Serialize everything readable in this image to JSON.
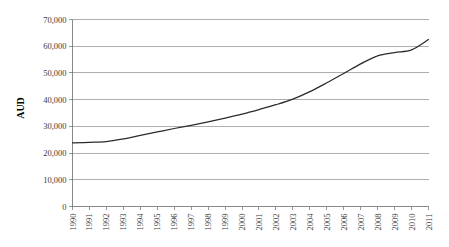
{
  "chart_data": {
    "type": "line",
    "title": "",
    "xlabel": "",
    "ylabel": "AUD",
    "ylim": [
      0,
      70000
    ],
    "ytick_values": [
      0,
      10000,
      20000,
      30000,
      40000,
      50000,
      60000,
      70000
    ],
    "ytick_labels": [
      "0",
      "10,000",
      "20,000",
      "30,000",
      "40,000",
      "50,000",
      "60,000",
      "70,000"
    ],
    "grid": true,
    "legend": "none",
    "line_color": "#2b2b2b",
    "categories": [
      "1990",
      "1991",
      "1992",
      "1993",
      "1994",
      "1995",
      "1996",
      "1997",
      "1998",
      "1999",
      "2000",
      "2001",
      "2002",
      "2003",
      "2004",
      "2005",
      "2006",
      "2007",
      "2008",
      "2009",
      "2010",
      "2011"
    ],
    "x": [
      1990,
      1991,
      1992,
      1993,
      1994,
      1995,
      1996,
      1997,
      1998,
      1999,
      2000,
      2001,
      2002,
      2003,
      2004,
      2005,
      2006,
      2007,
      2008,
      2009,
      2010,
      2011
    ],
    "series": [
      {
        "name": "AUD",
        "values": [
          23800,
          24000,
          24300,
          25300,
          26600,
          27900,
          29200,
          30400,
          31700,
          33100,
          34600,
          36300,
          38100,
          40200,
          43000,
          46300,
          49800,
          53400,
          56400,
          57600,
          58600,
          62500
        ]
      }
    ]
  }
}
